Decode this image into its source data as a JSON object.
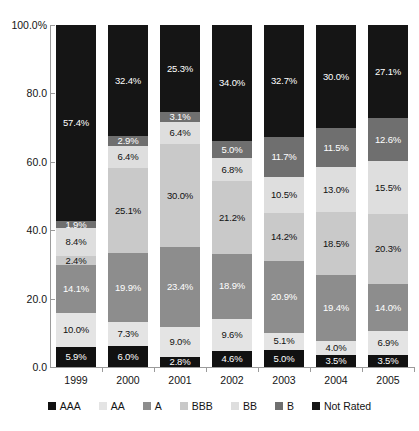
{
  "chart_data": {
    "type": "bar",
    "subtype": "stacked-bar-100-percent",
    "title": "",
    "xlabel": "",
    "ylabel": "",
    "ylim": [
      0,
      100
    ],
    "ytick_labels": [
      "0.0",
      "20.0",
      "40.0",
      "60.0",
      "80.0",
      "100.0%"
    ],
    "ytick_values": [
      0,
      20,
      40,
      60,
      80,
      100
    ],
    "grid": false,
    "legend_position": "bottom",
    "categories": [
      "1999",
      "2000",
      "2001",
      "2002",
      "2003",
      "2004",
      "2005"
    ],
    "stack_order_bottom_to_top": [
      "AAA",
      "AA",
      "A",
      "BBB",
      "BB",
      "B",
      "Not Rated"
    ],
    "series": [
      {
        "name": "AAA",
        "color": "#111111",
        "values": [
          5.9,
          6.0,
          2.8,
          4.6,
          5.0,
          3.5,
          3.5
        ]
      },
      {
        "name": "AA",
        "color": "#e4e4e4",
        "values": [
          10.0,
          7.3,
          9.0,
          9.6,
          5.1,
          4.0,
          6.9
        ]
      },
      {
        "name": "A",
        "color": "#8d8d8d",
        "values": [
          14.1,
          19.9,
          23.4,
          18.9,
          20.9,
          19.4,
          14.0
        ]
      },
      {
        "name": "BBB",
        "color": "#c9c9c9",
        "values": [
          2.4,
          25.1,
          30.0,
          21.2,
          14.2,
          18.5,
          20.3
        ]
      },
      {
        "name": "BB",
        "color": "#dedede",
        "values": [
          8.4,
          6.4,
          6.4,
          6.8,
          10.5,
          13.0,
          15.5
        ]
      },
      {
        "name": "B",
        "color": "#6f6f6f",
        "values": [
          1.9,
          2.9,
          3.1,
          5.0,
          11.7,
          11.5,
          12.6
        ]
      },
      {
        "name": "Not Rated",
        "color": "#151515",
        "values": [
          57.4,
          32.4,
          25.3,
          34.0,
          32.7,
          30.0,
          27.1
        ]
      }
    ],
    "data_labels": {
      "1999": [
        "5.9%",
        "10.0%",
        "14.1%",
        "2.4%",
        "8.4%",
        "1.9%",
        "57.4%"
      ],
      "2000": [
        "6.0%",
        "7.3%",
        "19.9%",
        "25.1%",
        "6.4%",
        "2.9%",
        "32.4%"
      ],
      "2001": [
        "2.8%",
        "9.0%",
        "23.4%",
        "30.0%",
        "6.4%",
        "3.1%",
        "25.3%"
      ],
      "2002": [
        "4.6%",
        "9.6%",
        "18.9%",
        "21.2%",
        "6.8%",
        "5.0%",
        "34.0%"
      ],
      "2003": [
        "5.0%",
        "5.1%",
        "20.9%",
        "14.2%",
        "10.5%",
        "11.7%",
        "32.7%"
      ],
      "2004": [
        "3.5%",
        "4.0%",
        "19.4%",
        "18.5%",
        "13.0%",
        "11.5%",
        "30.0%"
      ],
      "2005": [
        "3.5%",
        "6.9%",
        "14.0%",
        "20.3%",
        "15.5%",
        "12.6%",
        "27.1%"
      ]
    }
  },
  "legend": {
    "items": [
      {
        "label": "AAA",
        "key": "AAA"
      },
      {
        "label": "AA",
        "key": "AA"
      },
      {
        "label": "A",
        "key": "A"
      },
      {
        "label": "BBB",
        "key": "BBB"
      },
      {
        "label": "BB",
        "key": "BB"
      },
      {
        "label": "B",
        "key": "B"
      },
      {
        "label": "Not Rated",
        "key": "NR"
      }
    ]
  }
}
